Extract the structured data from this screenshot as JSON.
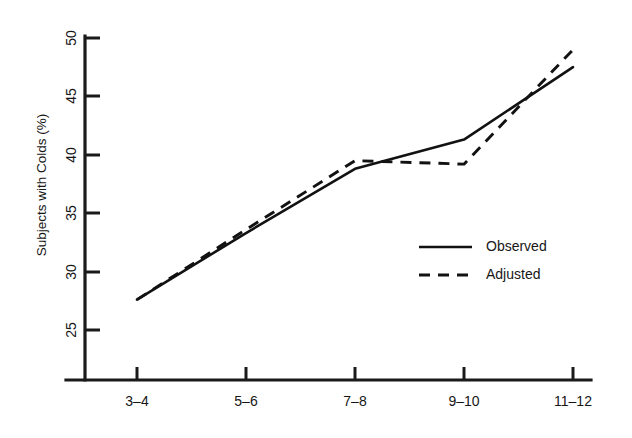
{
  "chart_data": {
    "type": "line",
    "title": "",
    "xlabel": "",
    "ylabel": "Subjects with Colds (%)",
    "categories": [
      "3–4",
      "5–6",
      "7–8",
      "9–10",
      "11–12"
    ],
    "series": [
      {
        "name": "Observed",
        "style": "solid",
        "values": [
          27.6,
          33.3,
          38.8,
          41.3,
          47.5
        ]
      },
      {
        "name": "Adjusted",
        "style": "dashed",
        "values": [
          27.6,
          33.6,
          39.5,
          39.2,
          49.0
        ]
      }
    ],
    "ylim": [
      23.0,
      50.0
    ],
    "yticks": [
      25,
      30,
      35,
      40,
      45,
      50
    ],
    "ytick_labels": [
      "25",
      "30",
      "35",
      "40",
      "45",
      "50"
    ],
    "xtick_labels": [
      "3–4",
      "5–6",
      "7–8",
      "9–10",
      "11–12"
    ],
    "grid": false,
    "legend_position": "center-right",
    "line_color": "#121212",
    "background_color": "#ffffff"
  },
  "axes": {
    "y_axis_title": "Subjects with Colds (%)",
    "y_tick_0": "25",
    "y_tick_1": "30",
    "y_tick_2": "35",
    "y_tick_3": "40",
    "y_tick_4": "45",
    "y_tick_5": "50",
    "x_tick_0": "3–4",
    "x_tick_1": "5–6",
    "x_tick_2": "7–8",
    "x_tick_3": "9–10",
    "x_tick_4": "11–12"
  },
  "legend": {
    "entry_0_label": "Observed",
    "entry_1_label": "Adjusted"
  }
}
